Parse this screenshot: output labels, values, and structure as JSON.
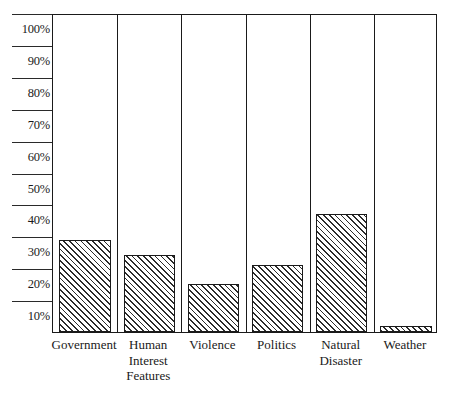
{
  "chart_data": {
    "type": "bar",
    "title": "",
    "xlabel": "",
    "ylabel": "",
    "ylim": [
      0,
      100
    ],
    "grid": false,
    "legend": "none",
    "categories": [
      "Government",
      "Human Interest Features",
      "Violence",
      "Politics",
      "Natural Disaster",
      "Weather"
    ],
    "category_lines": [
      [
        "Government"
      ],
      [
        "Human",
        "Interest",
        "Features"
      ],
      [
        "Violence"
      ],
      [
        "Politics"
      ],
      [
        "Natural",
        "Disaster"
      ],
      [
        "Weather"
      ]
    ],
    "values": [
      29,
      24,
      15,
      21,
      37,
      2
    ],
    "ytick_labels": [
      "100%",
      "90%",
      "80%",
      "70%",
      "60%",
      "50%",
      "40%",
      "30%",
      "20%",
      "10%"
    ],
    "ytick_values": [
      100,
      90,
      80,
      70,
      60,
      50,
      40,
      30,
      20,
      10
    ],
    "bar_fill": "diagonal-hatch",
    "colors": {
      "axis": "#1a1a1a",
      "bar_outline": "#1a1a1a",
      "hatch": "#2b2b2b",
      "background": "#ffffff"
    }
  }
}
